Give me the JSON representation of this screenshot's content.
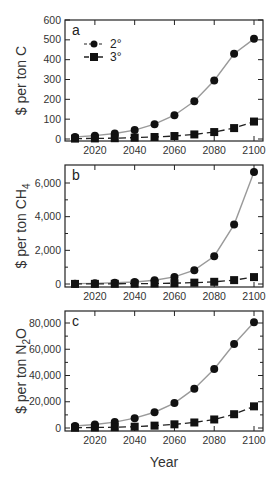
{
  "figure": {
    "xlabel": "Year",
    "legend": [
      {
        "label": "2°",
        "marker": "circle",
        "line": "solid-gray"
      },
      {
        "label": "3°",
        "marker": "square",
        "line": "dashed-black"
      }
    ]
  },
  "chart_data": [
    {
      "type": "line",
      "panel": "a",
      "title": "",
      "xlabel": "",
      "ylabel": "$ per ton C",
      "x": [
        2010,
        2020,
        2030,
        2040,
        2050,
        2060,
        2070,
        2080,
        2090,
        2100
      ],
      "xticks": [
        "2020",
        "2040",
        "2060",
        "2080",
        "2100"
      ],
      "yticks": [
        "0",
        "100",
        "200",
        "300",
        "400",
        "500",
        "600"
      ],
      "ylim": [
        0,
        600
      ],
      "series": [
        {
          "name": "2°",
          "values": [
            10,
            17,
            28,
            45,
            75,
            120,
            190,
            295,
            430,
            505
          ]
        },
        {
          "name": "3°",
          "values": [
            2,
            3,
            4,
            7,
            10,
            15,
            23,
            35,
            55,
            88
          ]
        }
      ],
      "legend_position": "upper left"
    },
    {
      "type": "line",
      "panel": "b",
      "title": "",
      "xlabel": "",
      "ylabel": "$ per ton CH4",
      "x": [
        2010,
        2020,
        2030,
        2040,
        2050,
        2060,
        2070,
        2080,
        2090,
        2100
      ],
      "xticks": [
        "2020",
        "2040",
        "2060",
        "2080",
        "2100"
      ],
      "yticks": [
        "0",
        "2,000",
        "4,000",
        "6,000"
      ],
      "ylim": [
        0,
        7000
      ],
      "series": [
        {
          "name": "2°",
          "values": [
            20,
            40,
            70,
            120,
            220,
            420,
            820,
            1650,
            3530,
            6650
          ]
        },
        {
          "name": "3°",
          "values": [
            5,
            8,
            12,
            20,
            30,
            50,
            80,
            130,
            230,
            410
          ]
        }
      ]
    },
    {
      "type": "line",
      "panel": "c",
      "title": "",
      "xlabel": "Year",
      "ylabel": "$ per ton N2O",
      "x": [
        2010,
        2020,
        2030,
        2040,
        2050,
        2060,
        2070,
        2080,
        2090,
        2100
      ],
      "xticks": [
        "2020",
        "2040",
        "2060",
        "2080",
        "2100"
      ],
      "yticks": [
        "0",
        "20,000",
        "40,000",
        "60,000",
        "80,000"
      ],
      "ylim": [
        0,
        88000
      ],
      "series": [
        {
          "name": "2°",
          "values": [
            1500,
            2700,
            4500,
            7500,
            12000,
            19000,
            30000,
            45000,
            64000,
            80500
          ]
        },
        {
          "name": "3°",
          "values": [
            200,
            400,
            600,
            1000,
            1800,
            2800,
            4200,
            6500,
            10500,
            16500
          ]
        }
      ]
    }
  ]
}
